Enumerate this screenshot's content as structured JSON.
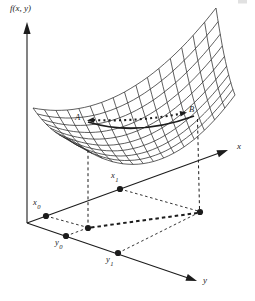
{
  "figure": {
    "background": "#ffffff",
    "ink": "#1c1c1c",
    "mesh_color": "#2b2b2b",
    "labels": {
      "z_axis": "f(x, y)",
      "x_axis": "x",
      "y_axis": "y",
      "point_a": "A",
      "point_b": "B",
      "x0": {
        "base": "x",
        "sub": "0"
      },
      "x1": {
        "base": "x",
        "sub": "1"
      },
      "y0": {
        "base": "y",
        "sub": "0"
      },
      "y1": {
        "base": "y",
        "sub": "1"
      }
    }
  }
}
